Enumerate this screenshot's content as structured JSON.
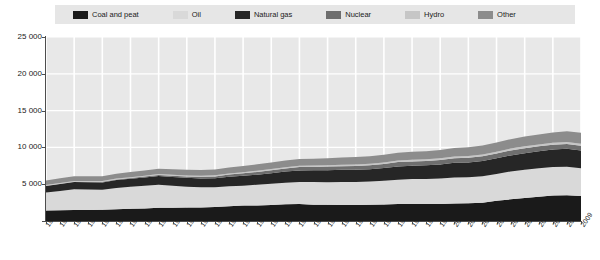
{
  "legend": {
    "position": "top",
    "items": [
      {
        "label": "Coal and peat",
        "color": "#1a1a1a"
      },
      {
        "label": "Oil",
        "color": "#d9d9d9"
      },
      {
        "label": "Natural gas",
        "color": "#262626"
      },
      {
        "label": "Nuclear",
        "color": "#6e6e6e"
      },
      {
        "label": "Hydro",
        "color": "#c6c6c6"
      },
      {
        "label": "Other",
        "color": "#8c8c8c"
      }
    ]
  },
  "axes": {
    "y_ticks": [
      "25 000",
      "20 000",
      "15 000",
      "10 000",
      "5 000",
      "0"
    ],
    "y_tick_values": [
      25000,
      20000,
      15000,
      10000,
      5000,
      0
    ]
  },
  "chart_data": {
    "type": "area",
    "title": "",
    "subtitle": "",
    "xlabel": "",
    "ylabel": "",
    "ylim": [
      0,
      25000
    ],
    "yticks": [
      0,
      5000,
      10000,
      15000,
      20000,
      25000
    ],
    "grid": true,
    "legend_position": "top",
    "stacked": true,
    "categories": [
      "1971",
      "1972",
      "1973",
      "1974",
      "1975",
      "1976",
      "1977",
      "1978",
      "1979",
      "1980",
      "1981",
      "1982",
      "1983",
      "1984",
      "1985",
      "1986",
      "1987",
      "1988",
      "1989",
      "1990",
      "1991",
      "1992",
      "1993",
      "1994",
      "1995",
      "1996",
      "1997",
      "1998",
      "1999",
      "2000",
      "2001",
      "2002",
      "2003",
      "2004",
      "2005",
      "2006",
      "2007",
      "2008",
      "2009"
    ],
    "series": [
      {
        "name": "Coal and peat",
        "color": "#1a1a1a",
        "values": [
          1440,
          1470,
          1500,
          1510,
          1540,
          1610,
          1670,
          1700,
          1800,
          1810,
          1820,
          1850,
          1900,
          1990,
          2090,
          2120,
          2190,
          2260,
          2300,
          2220,
          2200,
          2180,
          2190,
          2210,
          2250,
          2310,
          2320,
          2310,
          2300,
          2380,
          2400,
          2490,
          2750,
          2940,
          3120,
          3300,
          3450,
          3500,
          3400
        ]
      },
      {
        "name": "Oil",
        "color": "#d9d9d9",
        "values": [
          2420,
          2620,
          2800,
          2760,
          2700,
          2890,
          2980,
          3080,
          3130,
          2980,
          2840,
          2740,
          2690,
          2720,
          2700,
          2810,
          2860,
          2950,
          3010,
          3070,
          3080,
          3130,
          3110,
          3160,
          3220,
          3300,
          3380,
          3400,
          3470,
          3540,
          3560,
          3590,
          3650,
          3790,
          3840,
          3870,
          3880,
          3860,
          3770
        ]
      },
      {
        "name": "Natural gas",
        "color": "#262626",
        "values": [
          890,
          940,
          990,
          1000,
          1000,
          1060,
          1080,
          1120,
          1180,
          1190,
          1200,
          1200,
          1220,
          1310,
          1350,
          1370,
          1440,
          1500,
          1560,
          1590,
          1620,
          1640,
          1660,
          1660,
          1720,
          1810,
          1820,
          1850,
          1900,
          1980,
          2000,
          2060,
          2120,
          2180,
          2250,
          2300,
          2380,
          2440,
          2410
        ]
      },
      {
        "name": "Nuclear",
        "color": "#6e6e6e",
        "values": [
          30,
          40,
          50,
          60,
          80,
          90,
          110,
          130,
          140,
          160,
          190,
          210,
          240,
          290,
          340,
          370,
          400,
          430,
          450,
          460,
          490,
          500,
          520,
          540,
          560,
          580,
          580,
          590,
          620,
          640,
          650,
          660,
          660,
          680,
          680,
          670,
          660,
          660,
          640
        ]
      },
      {
        "name": "Hydro",
        "color": "#c6c6c6",
        "values": [
          100,
          105,
          105,
          110,
          115,
          115,
          120,
          125,
          130,
          135,
          140,
          145,
          150,
          155,
          160,
          165,
          170,
          175,
          180,
          185,
          190,
          195,
          200,
          205,
          210,
          220,
          225,
          225,
          230,
          235,
          235,
          240,
          240,
          250,
          255,
          260,
          270,
          280,
          285
        ]
      },
      {
        "name": "Other",
        "color": "#8c8c8c",
        "values": [
          620,
          630,
          640,
          650,
          660,
          670,
          690,
          700,
          720,
          740,
          760,
          780,
          800,
          820,
          840,
          860,
          880,
          900,
          920,
          940,
          960,
          980,
          1000,
          1020,
          1040,
          1060,
          1080,
          1100,
          1130,
          1160,
          1180,
          1210,
          1240,
          1280,
          1320,
          1360,
          1400,
          1440,
          1480
        ]
      }
    ]
  }
}
